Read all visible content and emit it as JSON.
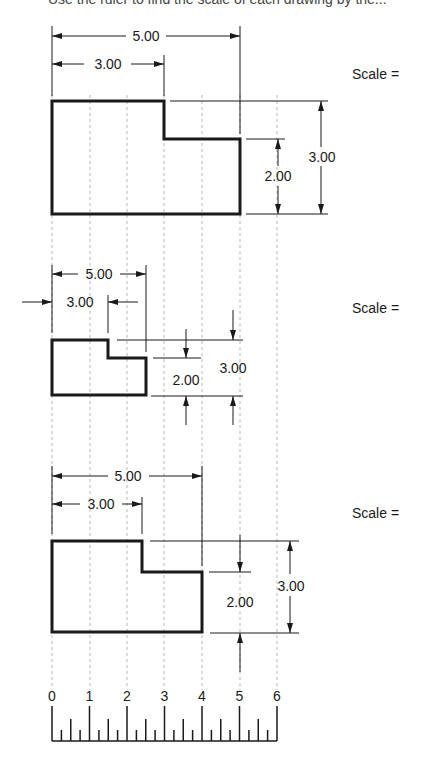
{
  "header": {
    "cut_off_text": "Use the ruler to find the scale of each drawing by the..."
  },
  "scale_labels": [
    "Scale =",
    "Scale =",
    "Scale ="
  ],
  "views": [
    {
      "overall_width": "5.00",
      "step_width": "3.00",
      "step_height": "2.00",
      "overall_height": "3.00"
    },
    {
      "overall_width": "5.00",
      "step_width": "3.00",
      "step_height": "2.00",
      "overall_height": "3.00"
    },
    {
      "overall_width": "5.00",
      "step_width": "3.00",
      "step_height": "2.00",
      "overall_height": "3.00"
    }
  ],
  "ruler": {
    "labels": [
      "0",
      "1",
      "2",
      "3",
      "4",
      "5",
      "6"
    ]
  },
  "colors": {
    "line": "#1a1a1a",
    "grid": "#b8b8b8",
    "background": "#ffffff"
  }
}
